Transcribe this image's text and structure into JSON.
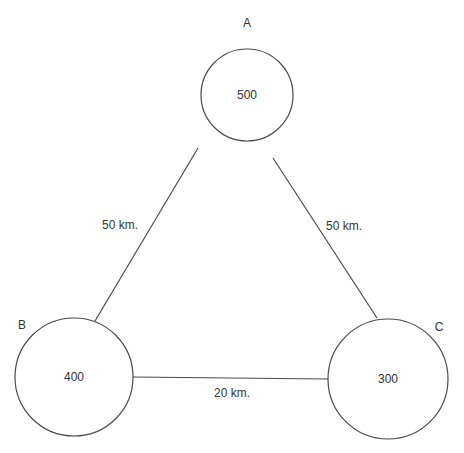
{
  "diagram": {
    "type": "network-graph",
    "nodes": [
      {
        "id": "A",
        "name": "A",
        "value": "500",
        "cx": 247,
        "cy": 95,
        "r": 46,
        "name_x": 247,
        "name_y": 27
      },
      {
        "id": "B",
        "name": "B",
        "value": "400",
        "cx": 74,
        "cy": 377,
        "r": 59,
        "name_x": 22,
        "name_y": 329
      },
      {
        "id": "C",
        "name": "C",
        "value": "300",
        "cx": 388,
        "cy": 379,
        "r": 60,
        "name_x": 439,
        "name_y": 331
      }
    ],
    "edges": [
      {
        "from": "A",
        "to": "B",
        "label": "50 km.",
        "x1": 198,
        "y1": 148,
        "x2": 95,
        "y2": 321,
        "lx": 120,
        "ly": 229
      },
      {
        "from": "A",
        "to": "C",
        "label": "50 km.",
        "x1": 273,
        "y1": 158,
        "x2": 377,
        "y2": 318,
        "lx": 344,
        "ly": 230
      },
      {
        "from": "B",
        "to": "C",
        "label": "20 km.",
        "x1": 133,
        "y1": 377,
        "x2": 328,
        "y2": 379,
        "lx": 232,
        "ly": 397
      }
    ]
  }
}
